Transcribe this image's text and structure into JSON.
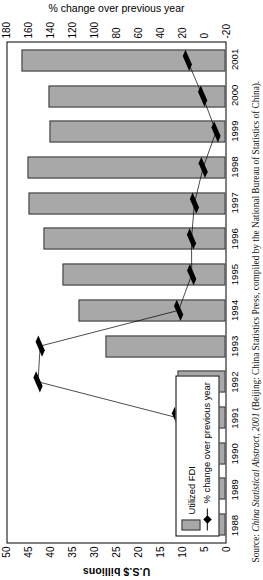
{
  "figure": {
    "source_prefix": "Source:",
    "source_title": "China Statistical Abstract, 2001",
    "source_rest": " (Beijing: China Statistics Press, compiled by the National Bureau of Statistics of China)."
  },
  "legend": {
    "bar_label": "Utilized FDI",
    "line_label": "% change over previous year",
    "bar_color": "#a8a8a8",
    "line_color": "#000000"
  },
  "chart_data": {
    "type": "bar",
    "title": "",
    "xlabel": "",
    "ylabel": "U.S.$ billions",
    "y2label": "% change over previous year",
    "categories": [
      "1988",
      "1989",
      "1990",
      "1991",
      "1992",
      "1993",
      "1994",
      "1995",
      "1996",
      "1997",
      "1998",
      "1999",
      "2000",
      "2001"
    ],
    "ylim": [
      0,
      50
    ],
    "yticks": [
      0,
      5,
      10,
      15,
      20,
      25,
      30,
      35,
      40,
      45,
      50
    ],
    "y2lim": [
      -20,
      180
    ],
    "y2ticks": [
      -20,
      0,
      20,
      40,
      60,
      80,
      100,
      120,
      140,
      160,
      180
    ],
    "grid": false,
    "legend_position": "lower-left",
    "series": [
      {
        "name": "Utilized FDI",
        "type": "bar",
        "axis": "left",
        "unit": "U.S.$ billions",
        "values": [
          3.2,
          3.4,
          3.5,
          4.4,
          11.0,
          27.5,
          33.8,
          37.5,
          41.7,
          45.3,
          45.5,
          40.4,
          40.7,
          46.8
        ]
      },
      {
        "name": "% change over previous year",
        "type": "line",
        "axis": "right",
        "unit": "%",
        "values": [
          6.0,
          6.5,
          2.8,
          25.0,
          152.0,
          150.0,
          23.0,
          11.0,
          11.2,
          8.5,
          0.5,
          -11.3,
          1.0,
          15.0
        ]
      }
    ]
  }
}
